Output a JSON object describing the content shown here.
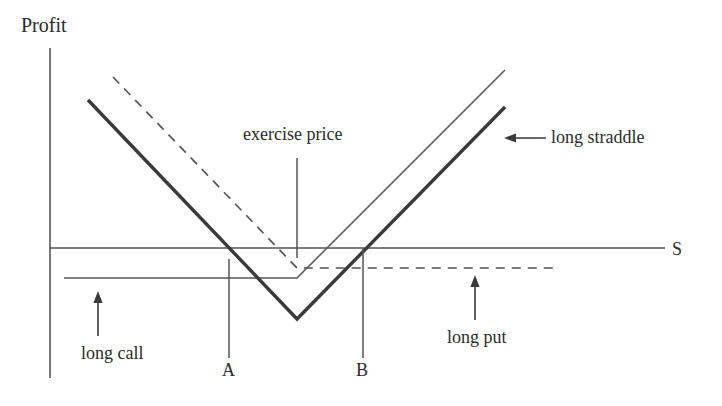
{
  "figure": {
    "title_label": "Profit",
    "x_axis_label": "S",
    "colors": {
      "axis": "#555555",
      "straddle": "#3a3a3a",
      "call": "#555555",
      "put": "#555555",
      "leader": "#555555",
      "text": "#2b2b2b",
      "background": "#ffffff"
    },
    "annotations": {
      "exercise_price": "exercise price",
      "long_straddle": "long straddle",
      "long_call": "long call",
      "long_put": "long put",
      "point_a": "A",
      "point_b": "B"
    }
  },
  "chart_data": {
    "type": "line",
    "title": "",
    "xlabel": "S",
    "ylabel": "Profit",
    "grid": false,
    "legend": "annotations-inline",
    "axis_origin": {
      "x": 50,
      "y": 248
    },
    "exercise_price_x": 297,
    "breakeven_points": {
      "A": 229,
      "B": 363
    },
    "series": [
      {
        "name": "long straddle",
        "style": "solid-thick",
        "points": [
          [
            88,
            100
          ],
          [
            297,
            319
          ],
          [
            505,
            107
          ]
        ]
      },
      {
        "name": "long call",
        "style": "solid-thin",
        "points": [
          [
            64,
            278
          ],
          [
            297,
            278
          ],
          [
            505,
            70
          ]
        ]
      },
      {
        "name": "long put",
        "style": "dashed",
        "points": [
          [
            113,
            77
          ],
          [
            297,
            268
          ],
          [
            553,
            268
          ]
        ]
      }
    ]
  }
}
